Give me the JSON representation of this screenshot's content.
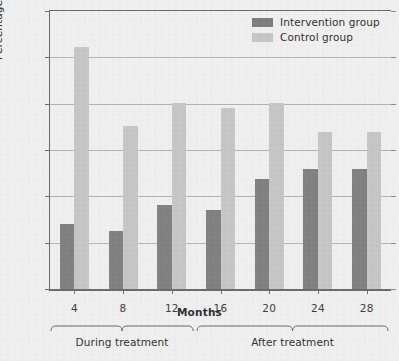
{
  "chart_data": {
    "type": "bar",
    "title": "",
    "xlabel": "Months",
    "ylabel": "Percentage needing institutional care",
    "categories": [
      "4",
      "8",
      "12",
      "16",
      "20",
      "24",
      "28"
    ],
    "ylim": [
      0,
      30
    ],
    "yticks": [
      0,
      5,
      10,
      15,
      20,
      25,
      30
    ],
    "ytick_labels": [
      "0",
      "5",
      "10",
      "15",
      "20",
      "25",
      "30"
    ],
    "grid": true,
    "legend_position": "top-right",
    "series": [
      {
        "name": "Intervention group",
        "color": "#808080",
        "values": [
          7.0,
          6.3,
          9.1,
          8.5,
          11.9,
          12.9,
          12.9
        ]
      },
      {
        "name": "Control group",
        "color": "#c6c6c6",
        "values": [
          26.1,
          17.6,
          20.1,
          19.5,
          20.1,
          16.9,
          16.9
        ]
      }
    ],
    "annotations": [
      {
        "label": "During treatment",
        "from_category": "4",
        "to_category": "12"
      },
      {
        "label": "After treatment",
        "from_category": "16",
        "to_category": "28"
      }
    ]
  },
  "legend": {
    "items": [
      {
        "label": "Intervention group",
        "color": "#808080"
      },
      {
        "label": "Control group",
        "color": "#c6c6c6"
      }
    ]
  },
  "axes": {
    "x_title": "Months",
    "y_title": "Percentage needing institutional care"
  },
  "brackets": [
    {
      "label": "During treatment"
    },
    {
      "label": "After treatment"
    }
  ],
  "colors": {
    "intervention": "#808080",
    "control": "#c6c6c6",
    "background": "#efefef",
    "axis": "#6b6b6b",
    "grid": "#b4b4b4",
    "text": "#2f2f2f"
  }
}
